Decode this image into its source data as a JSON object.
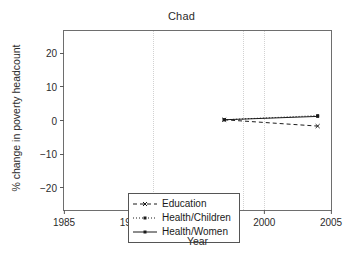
{
  "chart_data": {
    "type": "line",
    "title": "Chad",
    "xlabel": "Year",
    "ylabel": "% change in poverty headcount",
    "xlim": [
      1985,
      2005
    ],
    "ylim": [
      -24,
      24
    ],
    "xticks": [
      1985,
      1990,
      1995,
      2000,
      2005
    ],
    "yticks": [
      20,
      10,
      0,
      -10,
      -20
    ],
    "xtick_labels": [
      "1985",
      "1990",
      "1995",
      "2000",
      "2005"
    ],
    "ytick_labels": [
      "20",
      "10",
      "0",
      "−10",
      "−20"
    ],
    "grid": "vertical-dotted",
    "gridlines_x": [
      1990,
      1995,
      2000
    ],
    "legend_position": "lower-left",
    "x": [
      1997,
      2004
    ],
    "series": [
      {
        "name": "Education",
        "label": "Education",
        "linestyle": "dashed",
        "marker": "x",
        "color": "#1a1a1a",
        "values": [
          0.2,
          -1.5
        ]
      },
      {
        "name": "Health/Children",
        "label": "Health/Children",
        "linestyle": "dotted",
        "marker": "square",
        "color": "#1a1a1a",
        "values": [
          0.2,
          1.3
        ]
      },
      {
        "name": "Health/Women",
        "label": "Health/Women",
        "linestyle": "solid",
        "marker": "square",
        "color": "#1a1a1a",
        "values": [
          0.2,
          1.1
        ]
      }
    ]
  },
  "figure": {
    "title": "Chad",
    "xaxis_title": "Year",
    "yaxis_title": "% change in poverty headcount"
  },
  "axes": {
    "y": [
      {
        "label": "20"
      },
      {
        "label": "10"
      },
      {
        "label": "0"
      },
      {
        "label": "−10"
      },
      {
        "label": "−20"
      }
    ],
    "x": [
      {
        "label": "1985"
      },
      {
        "label": "1990"
      },
      {
        "label": "1995"
      },
      {
        "label": "2000"
      },
      {
        "label": "2005"
      }
    ]
  },
  "legend": {
    "entries": [
      {
        "label": "Education"
      },
      {
        "label": "Health/Children"
      },
      {
        "label": "Health/Women"
      }
    ]
  }
}
